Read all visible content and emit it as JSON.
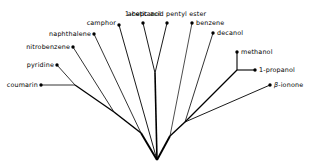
{
  "figure": {
    "type": "unrooted-tree-diagram",
    "background_color": "#ffffff",
    "line_color": "#000000",
    "width": 311,
    "height": 168
  },
  "labels": {
    "coumarin": "coumarin",
    "pyridine": "pyridine",
    "nitrobenzene": "nitrobenzene",
    "naphthalene": "naphthalene",
    "camphor": "camphor",
    "heptanol": "1-heptanol",
    "acetic_acid_pentyl_ester": "acetic acid pentyl ester",
    "benzene": "benzene",
    "decanol": "decanol",
    "methanol": "methanol",
    "propanol": "1-propanol",
    "ionone_prefix": "β",
    "ionone_suffix": "-ionone"
  },
  "chart_data": {
    "type": "tree",
    "title": "",
    "xlabel": "",
    "ylabel": "",
    "root": {
      "x": 157,
      "y": 160
    },
    "leaves": [
      {
        "name": "coumarin",
        "label": "coumarin",
        "x": 41,
        "y": 85,
        "label_x": 38,
        "label_y": 85,
        "anchor": "end"
      },
      {
        "name": "pyridine",
        "label": "pyridine",
        "x": 57,
        "y": 65,
        "label_x": 54,
        "label_y": 65,
        "anchor": "end"
      },
      {
        "name": "nitrobenzene",
        "label": "nitrobenzene",
        "x": 73,
        "y": 47,
        "label_x": 70,
        "label_y": 47,
        "anchor": "end"
      },
      {
        "name": "naphthalene",
        "label": "naphthalene",
        "x": 94,
        "y": 34,
        "label_x": 91,
        "label_y": 34,
        "anchor": "end"
      },
      {
        "name": "camphor",
        "label": "camphor",
        "x": 119,
        "y": 25,
        "label_x": 116,
        "label_y": 23,
        "anchor": "end"
      },
      {
        "name": "heptanol",
        "label": "1-heptanol",
        "x": 143,
        "y": 23,
        "label_x": 143,
        "label_y": 14,
        "anchor": "middle"
      },
      {
        "name": "acetic-acid-pentyl-ester",
        "label": "acetic acid pentyl ester",
        "x": 167,
        "y": 23,
        "label_x": 167,
        "label_y": 14,
        "anchor": "middle"
      },
      {
        "name": "benzene",
        "label": "benzene",
        "x": 192,
        "y": 23,
        "label_x": 196,
        "label_y": 23,
        "anchor": "start"
      },
      {
        "name": "decanol",
        "label": "decanol",
        "x": 213,
        "y": 33,
        "label_x": 217,
        "label_y": 33,
        "anchor": "start"
      },
      {
        "name": "methanol",
        "label": "methanol",
        "x": 237,
        "y": 52,
        "label_x": 241,
        "label_y": 52,
        "anchor": "start"
      },
      {
        "name": "propanol",
        "label": "1-propanol",
        "x": 255,
        "y": 70,
        "label_x": 259,
        "label_y": 70,
        "anchor": "start"
      },
      {
        "name": "ionone",
        "label": "β-ionone",
        "x": 270,
        "y": 85,
        "label_x": 274,
        "label_y": 85,
        "anchor": "start"
      }
    ],
    "internal_nodes": [
      {
        "name": "root",
        "x": 157,
        "y": 160
      },
      {
        "name": "left-node-a",
        "x": 141,
        "y": 133
      },
      {
        "name": "left-node-b",
        "x": 114,
        "y": 112
      },
      {
        "name": "left-node-c",
        "x": 75,
        "y": 85
      },
      {
        "name": "trunk-top",
        "x": 155,
        "y": 73
      },
      {
        "name": "right-node-a",
        "x": 170,
        "y": 136
      },
      {
        "name": "right-node-b",
        "x": 185,
        "y": 122
      },
      {
        "name": "right-node-c",
        "x": 237,
        "y": 70
      }
    ],
    "edges": [
      {
        "from": "root",
        "to": "left-node-a",
        "width": 1.9
      },
      {
        "from": "left-node-a",
        "to": "left-node-b",
        "width": 1.5
      },
      {
        "from": "left-node-b",
        "to": "left-node-c",
        "width": 1.3
      },
      {
        "from": "left-node-c",
        "to": "coumarin",
        "width": 0.8
      },
      {
        "from": "left-node-c",
        "to": "pyridine",
        "width": 0.8
      },
      {
        "from": "left-node-b",
        "to": "nitrobenzene",
        "width": 0.8
      },
      {
        "from": "left-node-a",
        "to": "naphthalene",
        "width": 0.8
      },
      {
        "from": "root",
        "to": "camphor",
        "width": 0.9
      },
      {
        "from": "root",
        "to": "trunk-top",
        "width": 1.6
      },
      {
        "from": "trunk-top",
        "to": "heptanol",
        "width": 0.9
      },
      {
        "from": "trunk-top",
        "to": "acetic-acid-pentyl-ester",
        "width": 0.9
      },
      {
        "from": "root",
        "to": "right-node-a",
        "width": 1.9
      },
      {
        "from": "right-node-a",
        "to": "benzene",
        "width": 0.7
      },
      {
        "from": "right-node-a",
        "to": "right-node-b",
        "width": 1.4
      },
      {
        "from": "right-node-b",
        "to": "decanol",
        "width": 0.8
      },
      {
        "from": "right-node-b",
        "to": "right-node-c",
        "width": 1.3
      },
      {
        "from": "right-node-c",
        "to": "methanol",
        "width": 1.1
      },
      {
        "from": "right-node-c",
        "to": "propanol",
        "width": 1.1
      },
      {
        "from": "right-node-b",
        "to": "ionone",
        "width": 0.9
      }
    ]
  }
}
